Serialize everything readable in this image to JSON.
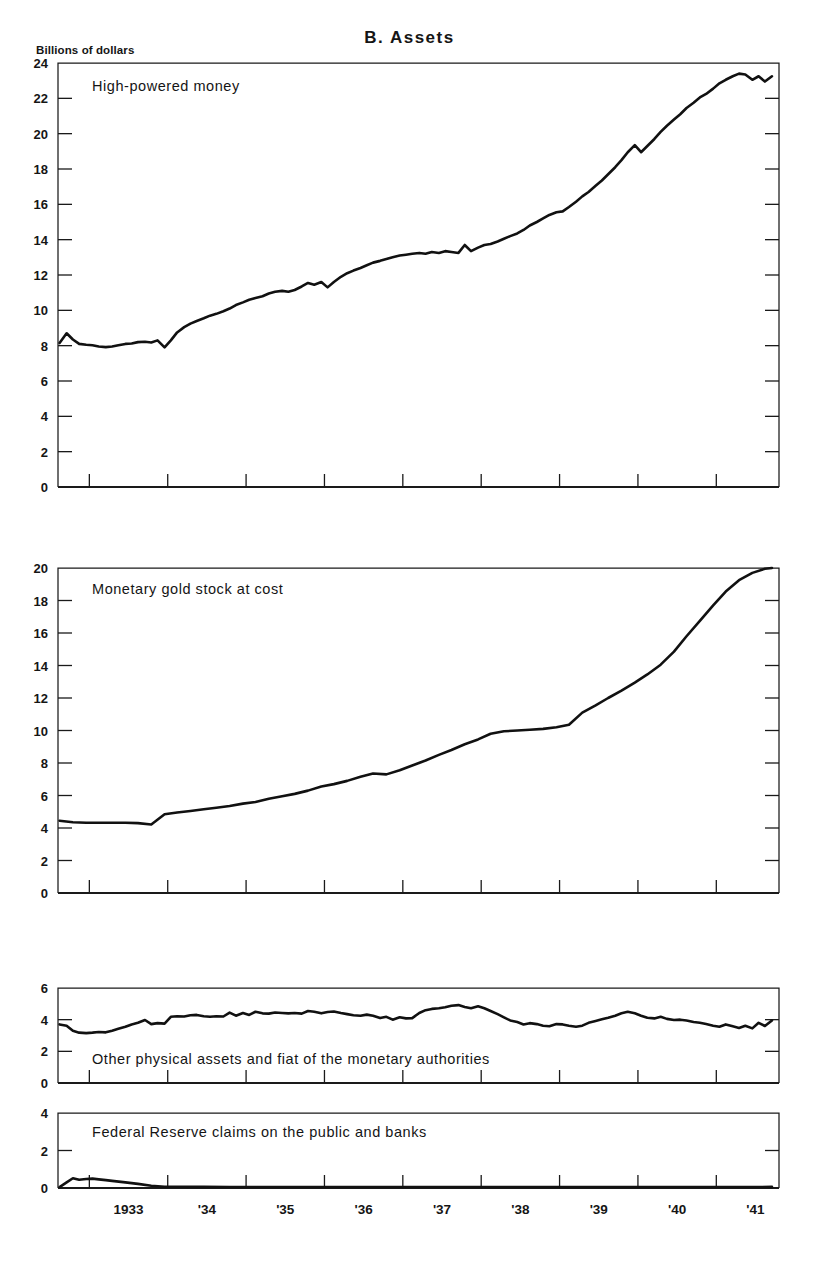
{
  "figure": {
    "title": "B.  Assets",
    "unit_label": "Billions of dollars",
    "background_color": "#ffffff",
    "line_color": "#111111"
  },
  "chart_data": {
    "type": "line",
    "title": "B.  Assets",
    "xlabel": "",
    "ylabel": "Billions of dollars",
    "grid": false,
    "legend": "in-panel labels",
    "x_axis": {
      "tick_labels": [
        "1933",
        "'34",
        "'35",
        "'36",
        "'37",
        "'38",
        "'39",
        "'40",
        "'41"
      ],
      "tick_positions_years": [
        1933.0,
        1934.0,
        1935.0,
        1936.0,
        1937.0,
        1938.0,
        1939.0,
        1940.0,
        1941.0
      ],
      "range": [
        1932.6,
        1941.8
      ],
      "note": "Vertical tick marks are drawn at the start of each year; year labels are centered within each year."
    },
    "panels": [
      {
        "id": "high-powered-money",
        "label": "High-powered money",
        "ylim": [
          0,
          24
        ],
        "yticks": [
          0,
          2,
          4,
          6,
          8,
          10,
          12,
          14,
          16,
          18,
          20,
          22,
          24
        ],
        "ytick_labels": [
          "0",
          "2",
          "4",
          "6",
          "8",
          "10",
          "12",
          "14",
          "16",
          "18",
          "20",
          "22",
          "24"
        ],
        "x": [
          1932.62,
          1932.71,
          1932.79,
          1932.87,
          1932.96,
          1933.04,
          1933.12,
          1933.21,
          1933.29,
          1933.37,
          1933.46,
          1933.54,
          1933.62,
          1933.71,
          1933.79,
          1933.87,
          1933.96,
          1934.04,
          1934.12,
          1934.21,
          1934.29,
          1934.37,
          1934.46,
          1934.54,
          1934.62,
          1934.71,
          1934.79,
          1934.87,
          1934.96,
          1935.04,
          1935.12,
          1935.21,
          1935.29,
          1935.37,
          1935.46,
          1935.54,
          1935.62,
          1935.71,
          1935.79,
          1935.87,
          1935.96,
          1936.04,
          1936.12,
          1936.21,
          1936.29,
          1936.37,
          1936.46,
          1936.54,
          1936.62,
          1936.71,
          1936.79,
          1936.87,
          1936.96,
          1937.04,
          1937.12,
          1937.21,
          1937.29,
          1937.37,
          1937.46,
          1937.54,
          1937.62,
          1937.71,
          1937.79,
          1937.87,
          1937.96,
          1938.04,
          1938.12,
          1938.21,
          1938.29,
          1938.37,
          1938.46,
          1938.54,
          1938.62,
          1938.71,
          1938.79,
          1938.87,
          1938.96,
          1939.04,
          1939.12,
          1939.21,
          1939.29,
          1939.37,
          1939.46,
          1939.54,
          1939.62,
          1939.71,
          1939.79,
          1939.87,
          1939.96,
          1940.04,
          1940.12,
          1940.21,
          1940.29,
          1940.37,
          1940.46,
          1940.54,
          1940.62,
          1940.71,
          1940.79,
          1940.87,
          1940.96,
          1941.04,
          1941.12,
          1941.21,
          1941.29,
          1941.37,
          1941.46,
          1941.54,
          1941.62,
          1941.71
        ],
        "y": [
          8.15,
          8.7,
          8.35,
          8.1,
          8.05,
          8.02,
          7.95,
          7.92,
          7.95,
          8.02,
          8.1,
          8.12,
          8.2,
          8.22,
          8.18,
          8.3,
          7.9,
          8.3,
          8.75,
          9.05,
          9.25,
          9.4,
          9.55,
          9.7,
          9.8,
          9.95,
          10.1,
          10.3,
          10.45,
          10.6,
          10.7,
          10.8,
          10.95,
          11.05,
          11.1,
          11.05,
          11.15,
          11.35,
          11.55,
          11.45,
          11.6,
          11.3,
          11.6,
          11.9,
          12.1,
          12.25,
          12.4,
          12.55,
          12.7,
          12.8,
          12.9,
          13.0,
          13.1,
          13.15,
          13.2,
          13.25,
          13.2,
          13.3,
          13.25,
          13.35,
          13.3,
          13.25,
          13.7,
          13.35,
          13.55,
          13.7,
          13.75,
          13.9,
          14.05,
          14.2,
          14.35,
          14.55,
          14.8,
          15.0,
          15.2,
          15.4,
          15.55,
          15.6,
          15.85,
          16.15,
          16.45,
          16.7,
          17.05,
          17.35,
          17.7,
          18.1,
          18.5,
          18.95,
          19.35,
          18.95,
          19.3,
          19.7,
          20.1,
          20.45,
          20.8,
          21.1,
          21.45,
          21.75,
          22.05,
          22.25,
          22.55,
          22.85,
          23.05,
          23.25,
          23.4,
          23.35,
          23.05,
          23.25,
          22.95,
          23.25,
          23.05,
          23.4,
          23.2,
          23.55,
          23.35,
          23.95
        ]
      },
      {
        "id": "monetary-gold-stock",
        "label": "Monetary gold stock at cost",
        "ylim": [
          0,
          20
        ],
        "yticks": [
          0,
          2,
          4,
          6,
          8,
          10,
          12,
          14,
          16,
          18,
          20
        ],
        "ytick_labels": [
          "0",
          "2",
          "4",
          "6",
          "8",
          "10",
          "12",
          "14",
          "16",
          "18",
          "20"
        ],
        "x": [
          1932.62,
          1932.79,
          1932.96,
          1933.12,
          1933.29,
          1933.46,
          1933.62,
          1933.79,
          1933.96,
          1934.12,
          1934.29,
          1934.46,
          1934.62,
          1934.79,
          1934.96,
          1935.12,
          1935.29,
          1935.46,
          1935.62,
          1935.79,
          1935.96,
          1936.12,
          1936.29,
          1936.46,
          1936.62,
          1936.79,
          1936.96,
          1937.12,
          1937.29,
          1937.46,
          1937.62,
          1937.79,
          1937.96,
          1938.12,
          1938.29,
          1938.46,
          1938.62,
          1938.79,
          1938.96,
          1939.12,
          1939.29,
          1939.46,
          1939.62,
          1939.79,
          1939.96,
          1940.12,
          1940.29,
          1940.46,
          1940.62,
          1940.79,
          1940.96,
          1941.12,
          1941.29,
          1941.46,
          1941.62,
          1941.71
        ],
        "y": [
          4.45,
          4.35,
          4.32,
          4.32,
          4.32,
          4.32,
          4.3,
          4.22,
          4.85,
          4.95,
          5.05,
          5.15,
          5.25,
          5.35,
          5.5,
          5.6,
          5.8,
          5.95,
          6.1,
          6.3,
          6.55,
          6.7,
          6.9,
          7.15,
          7.35,
          7.3,
          7.55,
          7.85,
          8.15,
          8.5,
          8.8,
          9.15,
          9.45,
          9.8,
          9.95,
          10.0,
          10.05,
          10.1,
          10.2,
          10.35,
          11.1,
          11.55,
          12.0,
          12.45,
          12.95,
          13.45,
          14.05,
          14.85,
          15.8,
          16.75,
          17.7,
          18.55,
          19.25,
          19.7,
          19.95,
          20.0
        ]
      },
      {
        "id": "other-physical-assets-and-fiat",
        "label": "Other physical assets and fiat of the monetary authorities",
        "ylim": [
          0,
          6
        ],
        "yticks": [
          0,
          2,
          4,
          6
        ],
        "ytick_labels": [
          "0",
          "2",
          "4",
          "6"
        ],
        "x": [
          1932.62,
          1932.71,
          1932.79,
          1932.87,
          1932.96,
          1933.04,
          1933.12,
          1933.21,
          1933.29,
          1933.37,
          1933.46,
          1933.54,
          1933.62,
          1933.71,
          1933.79,
          1933.87,
          1933.96,
          1934.04,
          1934.12,
          1934.21,
          1934.29,
          1934.37,
          1934.46,
          1934.54,
          1934.62,
          1934.71,
          1934.79,
          1934.87,
          1934.96,
          1935.04,
          1935.12,
          1935.21,
          1935.29,
          1935.37,
          1935.46,
          1935.54,
          1935.62,
          1935.71,
          1935.79,
          1935.87,
          1935.96,
          1936.04,
          1936.12,
          1936.21,
          1936.29,
          1936.37,
          1936.46,
          1936.54,
          1936.62,
          1936.71,
          1936.79,
          1936.87,
          1936.96,
          1937.04,
          1937.12,
          1937.21,
          1937.29,
          1937.37,
          1937.46,
          1937.54,
          1937.62,
          1937.71,
          1937.79,
          1937.87,
          1937.96,
          1938.04,
          1938.12,
          1938.21,
          1938.29,
          1938.37,
          1938.46,
          1938.54,
          1938.62,
          1938.71,
          1938.79,
          1938.87,
          1938.96,
          1939.04,
          1939.12,
          1939.21,
          1939.29,
          1939.37,
          1939.46,
          1939.54,
          1939.62,
          1939.71,
          1939.79,
          1939.87,
          1939.96,
          1940.04,
          1940.12,
          1940.21,
          1940.29,
          1940.37,
          1940.46,
          1940.54,
          1940.62,
          1940.71,
          1940.79,
          1940.87,
          1940.96,
          1941.04,
          1941.12,
          1941.21,
          1941.29,
          1941.37,
          1941.46,
          1941.54,
          1941.62,
          1941.71
        ],
        "y": [
          3.7,
          3.62,
          3.3,
          3.18,
          3.15,
          3.18,
          3.22,
          3.2,
          3.3,
          3.42,
          3.55,
          3.7,
          3.8,
          3.98,
          3.72,
          3.78,
          3.75,
          4.18,
          4.22,
          4.2,
          4.28,
          4.3,
          4.22,
          4.18,
          4.22,
          4.2,
          4.45,
          4.25,
          4.42,
          4.3,
          4.5,
          4.4,
          4.38,
          4.45,
          4.42,
          4.4,
          4.42,
          4.38,
          4.55,
          4.5,
          4.4,
          4.48,
          4.52,
          4.42,
          4.35,
          4.28,
          4.25,
          4.32,
          4.25,
          4.1,
          4.18,
          4.0,
          4.15,
          4.08,
          4.1,
          4.42,
          4.6,
          4.68,
          4.72,
          4.78,
          4.88,
          4.92,
          4.8,
          4.72,
          4.85,
          4.72,
          4.55,
          4.35,
          4.15,
          3.95,
          3.85,
          3.7,
          3.78,
          3.72,
          3.62,
          3.58,
          3.72,
          3.7,
          3.62,
          3.55,
          3.62,
          3.8,
          3.92,
          4.02,
          4.12,
          4.25,
          4.4,
          4.5,
          4.4,
          4.25,
          4.12,
          4.08,
          4.18,
          4.05,
          3.98,
          4.0,
          3.95,
          3.85,
          3.8,
          3.72,
          3.62,
          3.55,
          3.7,
          3.58,
          3.48,
          3.62,
          3.45,
          3.8,
          3.6,
          3.95
        ]
      },
      {
        "id": "federal-reserve-claims",
        "label": "Federal Reserve claims on the public and banks",
        "ylim": [
          0,
          4
        ],
        "yticks": [
          0,
          2,
          4
        ],
        "ytick_labels": [
          "0",
          "2",
          "4"
        ],
        "x": [
          1932.62,
          1932.71,
          1932.79,
          1932.87,
          1932.96,
          1933.04,
          1933.12,
          1933.21,
          1933.29,
          1933.46,
          1933.62,
          1933.79,
          1933.96,
          1934.21,
          1934.46,
          1934.79,
          1935.12,
          1935.46,
          1935.96,
          1936.46,
          1936.96,
          1937.46,
          1937.96,
          1938.46,
          1938.96,
          1939.46,
          1939.96,
          1940.46,
          1940.96,
          1941.46,
          1941.71
        ],
        "y": [
          0.05,
          0.3,
          0.52,
          0.44,
          0.48,
          0.5,
          0.46,
          0.42,
          0.38,
          0.3,
          0.22,
          0.12,
          0.07,
          0.07,
          0.06,
          0.05,
          0.05,
          0.05,
          0.05,
          0.05,
          0.05,
          0.05,
          0.05,
          0.05,
          0.05,
          0.05,
          0.05,
          0.05,
          0.05,
          0.05,
          0.06
        ]
      }
    ]
  }
}
